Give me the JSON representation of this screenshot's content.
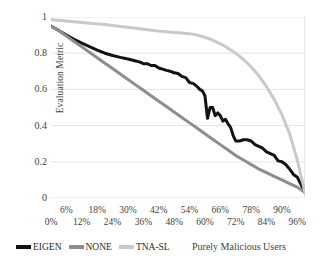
{
  "chart_data": {
    "type": "line",
    "title": "",
    "xlabel": "Purely Malicious Users",
    "ylabel": "Evaluation Metric",
    "xlim": [
      0,
      99
    ],
    "ylim": [
      0,
      1
    ],
    "grid": "horizontal",
    "legend_position": "bottom-left",
    "y_ticks": [
      "1",
      "0.8",
      "0.6",
      "0.4",
      "0.2",
      "0"
    ],
    "y_tick_values": [
      1,
      0.8,
      0.6,
      0.4,
      0.2,
      0
    ],
    "x_ticks_upper": [
      "6%",
      "18%",
      "30%",
      "42%",
      "54%",
      "66%",
      "78%",
      "90%"
    ],
    "x_tick_values_upper": [
      6,
      18,
      30,
      42,
      54,
      66,
      78,
      90
    ],
    "x_ticks_lower": [
      "0%",
      "12%",
      "24%",
      "36%",
      "48%",
      "60%",
      "72%",
      "84%",
      "96%"
    ],
    "x_tick_values_lower": [
      0,
      12,
      24,
      36,
      48,
      60,
      72,
      84,
      96
    ],
    "x": [
      0,
      3,
      6,
      9,
      12,
      15,
      18,
      21,
      24,
      27,
      30,
      33,
      36,
      39,
      42,
      45,
      48,
      51,
      54,
      57,
      60,
      63,
      66,
      69,
      72,
      75,
      78,
      81,
      84,
      87,
      90,
      93,
      96,
      99
    ],
    "series": [
      {
        "name": "EIGEN",
        "color": "#121212",
        "width": 3.0,
        "values": [
          0.95,
          0.925,
          0.9,
          0.875,
          0.855,
          0.835,
          0.815,
          0.8,
          0.785,
          0.775,
          0.765,
          0.755,
          0.74,
          0.73,
          0.715,
          0.7,
          0.685,
          0.665,
          0.635,
          0.615,
          0.6,
          0.44,
          0.5,
          0.46,
          0.425,
          0.435,
          0.395,
          0.345,
          0.315,
          0.32,
          0.315,
          0.29,
          0.255,
          0.03
        ]
      },
      {
        "name": "NONE",
        "color": "#8d8d8d",
        "width": 3.0,
        "values": [
          0.95,
          0.925,
          0.895,
          0.865,
          0.835,
          0.805,
          0.775,
          0.745,
          0.715,
          0.685,
          0.655,
          0.625,
          0.595,
          0.565,
          0.535,
          0.505,
          0.475,
          0.445,
          0.415,
          0.385,
          0.355,
          0.325,
          0.295,
          0.265,
          0.235,
          0.21,
          0.185,
          0.16,
          0.14,
          0.12,
          0.1,
          0.08,
          0.06,
          0.03
        ]
      },
      {
        "name": "TNA-SL",
        "color": "#c9c9c9",
        "width": 3.0,
        "values": [
          0.985,
          0.982,
          0.978,
          0.974,
          0.97,
          0.966,
          0.962,
          0.958,
          0.953,
          0.948,
          0.943,
          0.938,
          0.932,
          0.927,
          0.922,
          0.918,
          0.915,
          0.912,
          0.908,
          0.9,
          0.888,
          0.872,
          0.852,
          0.828,
          0.8,
          0.765,
          0.725,
          0.675,
          0.615,
          0.545,
          0.46,
          0.355,
          0.21,
          0.03
        ]
      }
    ],
    "eigen_detail_x": [
      0,
      3,
      6,
      9,
      12,
      15,
      18,
      21,
      24,
      27,
      30,
      33,
      34.5,
      36,
      37.5,
      39,
      40.5,
      42,
      43.5,
      45,
      46.5,
      48,
      49.5,
      51,
      52.5,
      54,
      55.5,
      57,
      58,
      59,
      60,
      61,
      62,
      63,
      64,
      65,
      66,
      67,
      68,
      69,
      70,
      71,
      72,
      73.5,
      75,
      76.5,
      78,
      79.5,
      81,
      82.5,
      84,
      85.5,
      87,
      88.5,
      90,
      91.5,
      93,
      94.5,
      96,
      99
    ],
    "eigen_detail_y": [
      0.95,
      0.925,
      0.9,
      0.877,
      0.856,
      0.836,
      0.817,
      0.8,
      0.787,
      0.777,
      0.768,
      0.757,
      0.752,
      0.742,
      0.742,
      0.732,
      0.732,
      0.718,
      0.712,
      0.705,
      0.7,
      0.692,
      0.688,
      0.672,
      0.665,
      0.638,
      0.632,
      0.615,
      0.6,
      0.592,
      0.565,
      0.44,
      0.5,
      0.5,
      0.455,
      0.47,
      0.455,
      0.425,
      0.435,
      0.41,
      0.39,
      0.345,
      0.315,
      0.315,
      0.322,
      0.322,
      0.315,
      0.295,
      0.285,
      0.275,
      0.255,
      0.245,
      0.235,
      0.205,
      0.2,
      0.185,
      0.16,
      0.13,
      0.115,
      0.03
    ]
  },
  "legend": {
    "items": [
      {
        "label": "EIGEN",
        "color": "#121212"
      },
      {
        "label": "NONE",
        "color": "#8d8d8d"
      },
      {
        "label": "TNA-SL",
        "color": "#c9c9c9"
      }
    ]
  }
}
